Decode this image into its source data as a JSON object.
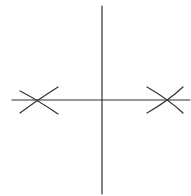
{
  "diagram": {
    "type": "geometric-construction",
    "canvas": {
      "width": 191,
      "height": 196,
      "background": "#ffffff"
    },
    "stroke_color": "#333333",
    "stroke_width": 1.2,
    "horizontal_line": {
      "x1": 12,
      "y1": 100,
      "x2": 190,
      "y2": 100
    },
    "vertical_line": {
      "x1": 102,
      "y1": 6,
      "x2": 102,
      "y2": 194
    },
    "left_marks": {
      "intersection": {
        "x": 35,
        "y": 100
      },
      "arc_a": "M 20 91 Q 36 99 58 114",
      "arc_b": "M 20 113 Q 36 101 58 87"
    },
    "right_marks": {
      "intersection": {
        "x": 169,
        "y": 100
      },
      "arc_a": "M 147 87 Q 168 99 183 113",
      "arc_b": "M 147 113 Q 168 101 183 87"
    }
  }
}
